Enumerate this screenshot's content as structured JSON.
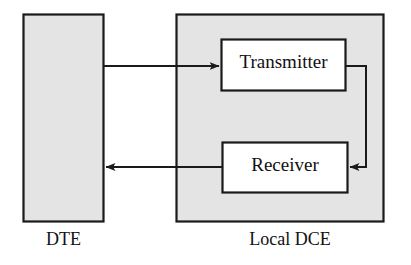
{
  "diagram": {
    "background_color": "#ffffff",
    "stroke_color": "#1a1a1a",
    "container_fill": "#e4e4e4",
    "inner_fill": "#ffffff",
    "nodes": [
      {
        "id": "dte",
        "label": "",
        "caption": "DTE",
        "kind": "container",
        "fill": "#e4e4e4"
      },
      {
        "id": "local-dce",
        "label": "",
        "caption": "Local DCE",
        "kind": "container",
        "fill": "#e4e4e4"
      },
      {
        "id": "transmitter",
        "label": "Transmitter",
        "caption": "",
        "kind": "block",
        "fill": "#ffffff"
      },
      {
        "id": "receiver",
        "label": "Receiver",
        "caption": "",
        "kind": "block",
        "fill": "#ffffff"
      }
    ],
    "edges": [
      {
        "id": "dte-to-transmitter",
        "from": "dte",
        "to": "transmitter",
        "label": "",
        "arrowhead": "end",
        "direction": "right"
      },
      {
        "id": "transmitter-to-receiver-loopback",
        "from": "transmitter",
        "to": "receiver",
        "label": "",
        "arrowhead": "end",
        "direction": "right-down-left"
      },
      {
        "id": "receiver-to-dte",
        "from": "receiver",
        "to": "dte",
        "label": "",
        "arrowhead": "end",
        "direction": "left"
      }
    ]
  }
}
